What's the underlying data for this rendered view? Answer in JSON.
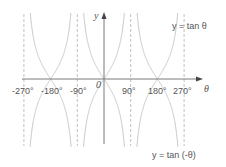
{
  "chart_data": {
    "type": "line",
    "title": "",
    "xlabel": "θ",
    "ylabel": "y",
    "x_ticks": [
      "-270°",
      "-180°",
      "-90°",
      "0",
      "90°",
      "180°",
      "270°"
    ],
    "x_tick_values": [
      -270,
      -180,
      -90,
      0,
      90,
      180,
      270
    ],
    "xlim": [
      -275,
      290
    ],
    "grid": false,
    "asymptotes_x": [
      -270,
      -90,
      90,
      270
    ],
    "series": [
      {
        "name": "y = tan θ",
        "function": "tan(theta)",
        "label_position": "top-right"
      },
      {
        "name": "y = tan (-θ)",
        "function": "tan(-theta)",
        "label_position": "bottom-right"
      }
    ],
    "intersections": [
      [
        -180,
        0
      ],
      [
        0,
        0
      ],
      [
        180,
        0
      ]
    ]
  },
  "labels": {
    "y_axis": "y",
    "x_axis": "θ",
    "origin": "0",
    "curve_tan": "y = tan θ",
    "curve_tan_neg": "y = tan (-θ)",
    "ticks": [
      "-270°",
      "-180°",
      "-90°",
      "90°",
      "180°",
      "270°"
    ]
  },
  "colors": {
    "axis": "#7a7a7a",
    "curve": "#c8c8c8",
    "asymptote": "#b0b0b0",
    "text": "#555555"
  }
}
